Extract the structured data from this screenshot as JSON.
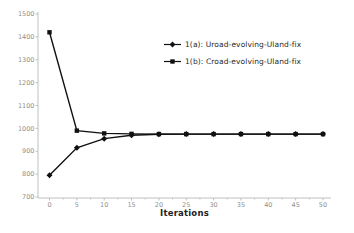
{
  "chart_data": {
    "type": "line",
    "title": "",
    "xlabel": "Iterations",
    "ylabel": "",
    "xlim": [
      0,
      50
    ],
    "ylim": [
      700,
      1500
    ],
    "x_ticks": [
      0,
      5,
      10,
      15,
      20,
      25,
      30,
      35,
      40,
      45,
      50
    ],
    "x_minor_tick_step": 2.5,
    "y_ticks": [
      700,
      800,
      900,
      1000,
      1100,
      1200,
      1300,
      1400,
      1500
    ],
    "grid": false,
    "legend_position": "upper-right-inside",
    "x": [
      0,
      5,
      10,
      15,
      20,
      25,
      30,
      35,
      40,
      45,
      50
    ],
    "series": [
      {
        "name": "1(a): Uroad-evolving-Uland-fix",
        "marker": "diamond",
        "color": "#111111",
        "values": [
          795,
          915,
          955,
          970,
          974,
          975,
          975,
          975,
          975,
          975,
          975
        ]
      },
      {
        "name": "1(b): Croad-evolving-Uland-fix",
        "marker": "square",
        "color": "#111111",
        "values": [
          1420,
          990,
          978,
          976,
          975,
          975,
          975,
          975,
          975,
          975,
          975
        ]
      }
    ]
  },
  "colors": {
    "background": "#ffffff",
    "axis": "#c0c0c0",
    "tick_label": "#8f8f8f",
    "series": "#111111",
    "xlabel_text": "#222222",
    "legend_text": "#2a2a2a"
  }
}
